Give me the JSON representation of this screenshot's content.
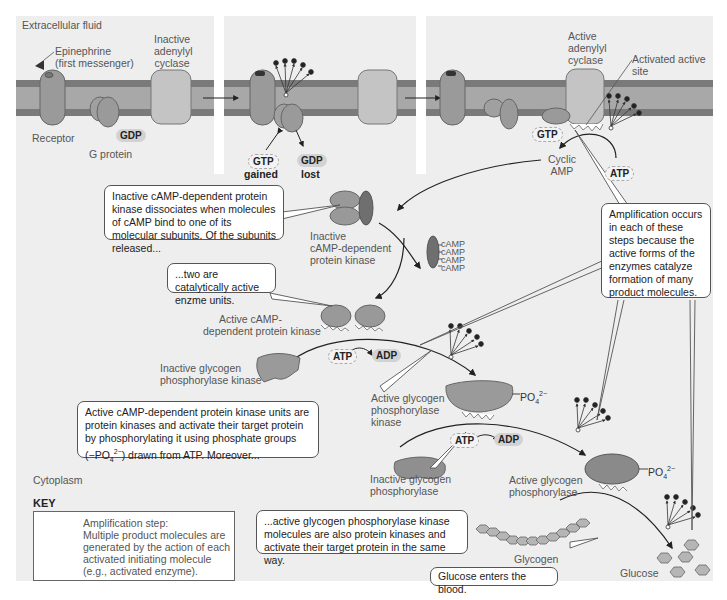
{
  "regions": {
    "extracellular": "Extracellular fluid",
    "cytoplasm": "Cytoplasm"
  },
  "panel1": {
    "epinephrine": "Epinephrine",
    "epinephrine_sub": "(first messenger)",
    "inactive_ac_1": "Inactive",
    "inactive_ac_2": "adenylyl",
    "inactive_ac_3": "cyclase",
    "receptor": "Receptor",
    "g_protein": "G protein",
    "gdp": "GDP"
  },
  "panel2": {
    "gtp": "GTP",
    "gtp_caption": "gained",
    "gdp": "GDP",
    "gdp_caption": "lost"
  },
  "panel3": {
    "active_ac_1": "Active",
    "active_ac_2": "adenylyl",
    "active_ac_3": "cyclase",
    "activated_site_1": "Activated active",
    "activated_site_2": "site",
    "gtp": "GTP",
    "cyclic_amp_1": "Cyclic",
    "cyclic_amp_2": "AMP",
    "atp": "ATP"
  },
  "pka": {
    "inactive_1": "Inactive",
    "inactive_2": "cAMP-dependent",
    "inactive_3": "protein kinase",
    "camp": [
      "cAMP",
      "cAMP",
      "cAMP",
      "cAMP"
    ],
    "active_1": "Active cAMP-",
    "active_2": "dependent protein kinase",
    "atp": "ATP",
    "adp": "ADP"
  },
  "phk": {
    "inactive_1": "Inactive glycogen",
    "inactive_2": "phosphorylase kinase",
    "active_1": "Active glycogen",
    "active_2": "phosphorylase",
    "active_3": "kinase",
    "po4": "PO",
    "po4_sub": "4",
    "po4_sup": "2−",
    "atp": "ATP",
    "adp": "ADP"
  },
  "gp": {
    "inactive_1": "Inactive glycogen",
    "inactive_2": "phosphorylase",
    "active_1": "Active glycogen",
    "active_2": "phosphorylase",
    "po4": "PO",
    "po4_sub": "4",
    "po4_sup": "2−"
  },
  "products": {
    "glycogen": "Glycogen",
    "glucose": "Glucose"
  },
  "callouts": {
    "dissociates": "Inactive cAMP-dependent protein kinase dissociates when molecules of cAMP bind to one of its molecular subunits. Of the subunits released...",
    "two_active": "...two are catalytically active enzme units.",
    "amplification": "Amplification occurs in each of these steps because the active forms of the enzymes catalyze formation of many product molecules.",
    "pka_units_1": "Active cAMP-dependent protein kinase units are protein kinases and activate their target protein by phosphorylating it using phosphate groups",
    "pka_units_2a": "(−PO",
    "pka_units_2sub": "4",
    "pka_units_2sup": "2−",
    "pka_units_2b": ") drawn from ATP. Moreover...",
    "phk_units": "...active glycogen phosphorylase kinase molecules are also protein kinases and activate their target protein in the same way.",
    "glucose_blood": "Glucose enters the blood."
  },
  "key": {
    "title": "KEY",
    "line1": "Amplification step:",
    "line2": "Multiple product molecules are generated by the action of each activated initiating molecule (e.g., activated enzyme)."
  },
  "colors": {
    "panel_bg": "#eeeeee",
    "membrane_dark": "#777777",
    "membrane_light": "#a8a8a8",
    "protein": "#9a9a9a",
    "protein_light": "#c4c4c4",
    "dark_subunit": "#6f6f6f"
  }
}
